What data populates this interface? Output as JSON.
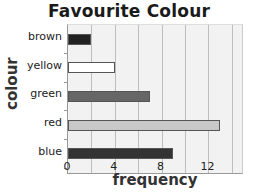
{
  "chart_data": {
    "type": "bar",
    "orientation": "horizontal",
    "title": "Favourite Colour",
    "xlabel": "frequency",
    "ylabel": "colour",
    "categories": [
      "brown",
      "yellow",
      "green",
      "red",
      "blue"
    ],
    "values": [
      2,
      4,
      7,
      13,
      9
    ],
    "bar_colors": [
      "#222222",
      "#ffffff",
      "#666666",
      "#c8c8c8",
      "#333333"
    ],
    "xlim": [
      0,
      15
    ],
    "xticks": [
      0,
      4,
      8,
      12
    ],
    "grid": {
      "vertical": true,
      "step": 2
    },
    "legend": null
  },
  "labels": {
    "title": "Favourite Colour",
    "xlabel": "frequency",
    "ylabel": "colour",
    "categories": [
      "brown",
      "yellow",
      "green",
      "red",
      "blue"
    ],
    "xticks": [
      "0",
      "4",
      "8",
      "12"
    ]
  }
}
